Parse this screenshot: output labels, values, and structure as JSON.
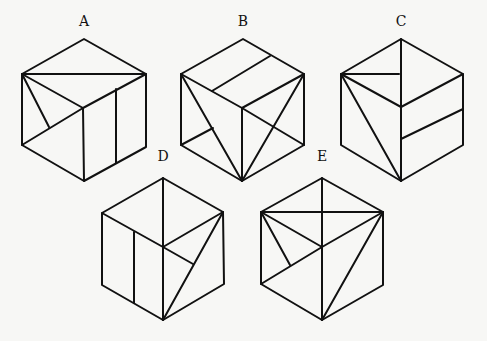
{
  "figure": {
    "stroke_color": "#111111",
    "background": "#f7f7f5"
  },
  "cubes": [
    {
      "label": "A",
      "label_pos": [
        84,
        22
      ],
      "outline": [
        [
          84,
          39
        ],
        [
          146,
          74
        ],
        [
          146,
          147
        ],
        [
          84,
          181
        ],
        [
          22,
          145
        ],
        [
          22,
          74
        ]
      ],
      "edges": [
        [
          [
            22,
            74
          ],
          [
            83,
            108
          ]
        ],
        [
          [
            146,
            74
          ],
          [
            83,
            108
          ]
        ],
        [
          [
            83,
            108
          ],
          [
            84,
            181
          ]
        ]
      ],
      "extra": [
        [
          [
            22,
            74
          ],
          [
            146,
            74
          ]
        ],
        [
          [
            22,
            145
          ],
          [
            83,
            108
          ]
        ],
        [
          [
            22,
            74
          ],
          [
            49,
            127
          ]
        ],
        [
          [
            116,
            89
          ],
          [
            116,
            163
          ]
        ]
      ]
    },
    {
      "label": "B",
      "label_pos": [
        243,
        22
      ],
      "outline": [
        [
          243,
          39
        ],
        [
          304,
          74
        ],
        [
          304,
          145
        ],
        [
          242,
          181
        ],
        [
          181,
          145
        ],
        [
          181,
          74
        ]
      ],
      "edges": [
        [
          [
            181,
            74
          ],
          [
            242,
            108
          ]
        ],
        [
          [
            304,
            74
          ],
          [
            242,
            108
          ]
        ],
        [
          [
            242,
            108
          ],
          [
            242,
            181
          ]
        ]
      ],
      "extra": [
        [
          [
            212,
            91
          ],
          [
            270,
            56
          ]
        ],
        [
          [
            181,
            74
          ],
          [
            242,
            181
          ]
        ],
        [
          [
            304,
            74
          ],
          [
            242,
            181
          ]
        ],
        [
          [
            242,
            108
          ],
          [
            304,
            145
          ]
        ],
        [
          [
            181,
            145
          ],
          [
            213,
            128
          ]
        ]
      ]
    },
    {
      "label": "C",
      "label_pos": [
        401,
        22
      ],
      "outline": [
        [
          401,
          39
        ],
        [
          463,
          74
        ],
        [
          463,
          145
        ],
        [
          401,
          181
        ],
        [
          341,
          145
        ],
        [
          341,
          74
        ]
      ],
      "edges": [
        [
          [
            341,
            74
          ],
          [
            401,
            107
          ]
        ],
        [
          [
            463,
            74
          ],
          [
            401,
            107
          ]
        ],
        [
          [
            401,
            107
          ],
          [
            401,
            181
          ]
        ]
      ],
      "extra": [
        [
          [
            401,
            39
          ],
          [
            401,
            107
          ]
        ],
        [
          [
            341,
            74
          ],
          [
            399,
            74
          ]
        ],
        [
          [
            341,
            74
          ],
          [
            401,
            181
          ]
        ],
        [
          [
            401,
            139
          ],
          [
            463,
            109
          ]
        ]
      ]
    },
    {
      "label": "D",
      "label_pos": [
        163,
        157
      ],
      "outline": [
        [
          163,
          178
        ],
        [
          223,
          212
        ],
        [
          224,
          284
        ],
        [
          163,
          320
        ],
        [
          102,
          285
        ],
        [
          102,
          213
        ]
      ],
      "edges": [
        [
          [
            102,
            213
          ],
          [
            163,
            247
          ]
        ],
        [
          [
            223,
            212
          ],
          [
            163,
            247
          ]
        ],
        [
          [
            163,
            247
          ],
          [
            163,
            320
          ]
        ]
      ],
      "extra": [
        [
          [
            163,
            178
          ],
          [
            163,
            247
          ]
        ],
        [
          [
            134,
            232
          ],
          [
            134,
            303
          ]
        ],
        [
          [
            223,
            212
          ],
          [
            163,
            320
          ]
        ],
        [
          [
            163,
            247
          ],
          [
            193,
            264
          ]
        ]
      ]
    },
    {
      "label": "E",
      "label_pos": [
        322,
        157
      ],
      "outline": [
        [
          322,
          178
        ],
        [
          383,
          212
        ],
        [
          383,
          285
        ],
        [
          322,
          320
        ],
        [
          261,
          284
        ],
        [
          261,
          212
        ]
      ],
      "edges": [
        [
          [
            261,
            212
          ],
          [
            322,
            247
          ]
        ],
        [
          [
            383,
            212
          ],
          [
            322,
            247
          ]
        ],
        [
          [
            322,
            247
          ],
          [
            322,
            320
          ]
        ]
      ],
      "extra": [
        [
          [
            261,
            212
          ],
          [
            383,
            212
          ]
        ],
        [
          [
            322,
            178
          ],
          [
            322,
            247
          ]
        ],
        [
          [
            261,
            284
          ],
          [
            322,
            247
          ]
        ],
        [
          [
            261,
            212
          ],
          [
            290,
            265
          ]
        ],
        [
          [
            383,
            212
          ],
          [
            322,
            320
          ]
        ]
      ]
    }
  ]
}
